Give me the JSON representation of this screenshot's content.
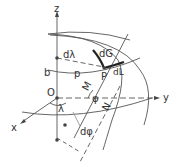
{
  "diagram": {
    "type": "ellipsoid-geometry",
    "colors": {
      "line": "#444444",
      "bold": "#222222",
      "light": "#999999",
      "background": "#ffffff"
    },
    "labels": {
      "z_axis": "z",
      "y_axis": "y",
      "x_axis": "x",
      "origin": "O",
      "b": "b",
      "point": "P",
      "p": "p",
      "d_lambda": "dλ",
      "d_G": "dG",
      "d_L": "dL",
      "M": "M",
      "N": "N",
      "phi": "φ",
      "lambda": "λ",
      "d_phi": "dφ"
    }
  }
}
